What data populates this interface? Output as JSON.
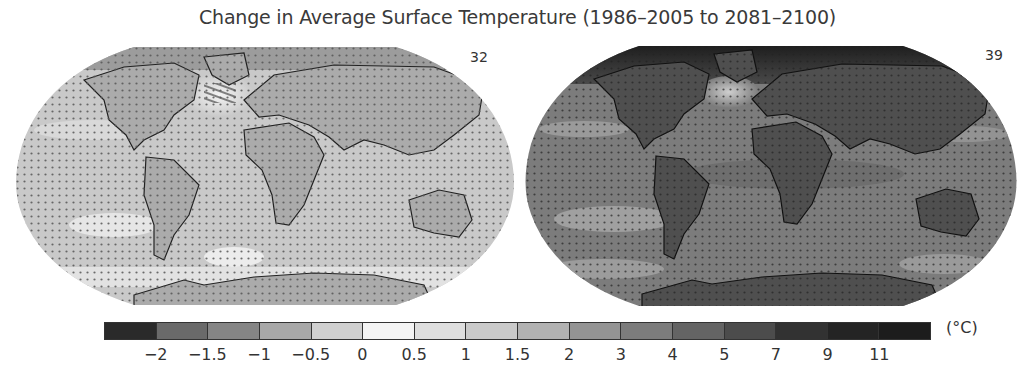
{
  "title": "Change in Average Surface Temperature (1986–2005 to 2081–2100)",
  "maps": [
    {
      "id": "low-emissions",
      "model_count_label": "32",
      "ocean_color": "#c9c9c9",
      "land_color": "#a9a9a9",
      "arctic_color": "#8f8f8f",
      "north_atlantic_color": "#eeeeee",
      "southern_ocean_color": "#e4e4e4",
      "stippled": true,
      "hatched_region": "North Atlantic"
    },
    {
      "id": "high-emissions",
      "model_count_label": "39",
      "ocean_color": "#7c7c7c",
      "land_color": "#4e4e4e",
      "arctic_color": "#202020",
      "north_atlantic_color": "#b8b8b8",
      "southern_ocean_color": "#9a9a9a",
      "stippled": true,
      "hatched_region": ""
    }
  ],
  "legend": {
    "unit": "(°C)",
    "swatches": [
      "#2a2a2a",
      "#6a6a6a",
      "#858585",
      "#a8a8a8",
      "#d0d0d0",
      "#f4f4f4",
      "#dedede",
      "#cacaca",
      "#b2b2b2",
      "#949494",
      "#7c7c7c",
      "#646464",
      "#4c4c4c",
      "#323232",
      "#242424",
      "#1c1c1c"
    ],
    "ticks": [
      "−2",
      "−1.5",
      "−1",
      "−0.5",
      "0",
      "0.5",
      "1",
      "1.5",
      "2",
      "3",
      "4",
      "5",
      "7",
      "9",
      "11"
    ]
  },
  "chart_data": {
    "type": "heatmap",
    "title": "Change in Average Surface Temperature (1986–2005 to 2081–2100)",
    "panels": [
      {
        "label": "32",
        "description": "Lower-emission scenario map; most regions +0.5 to +2 °C, land and Arctic warmer, small cooling/hatched area in North Atlantic"
      },
      {
        "label": "39",
        "description": "Higher-emission scenario map; most regions +3 to +5 °C, land +4 to +7 °C, Arctic +7 to +11 °C, North Atlantic least warming"
      }
    ],
    "colorbar": {
      "boundaries": [
        -2,
        -1.5,
        -1,
        -0.5,
        0,
        0.5,
        1,
        1.5,
        2,
        3,
        4,
        5,
        7,
        9,
        11
      ],
      "bins": 16,
      "unit": "°C"
    },
    "legend_position": "bottom"
  }
}
